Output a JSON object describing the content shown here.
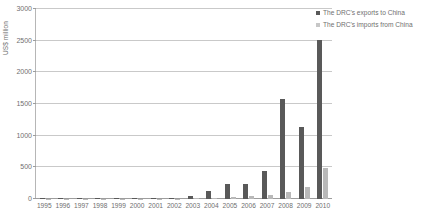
{
  "chart_data": {
    "type": "bar",
    "title": "",
    "xlabel": "",
    "ylabel": "US$ million",
    "ylim": [
      0,
      3000
    ],
    "yticks": [
      0,
      500,
      1000,
      1500,
      2000,
      2500,
      3000
    ],
    "ytick_labels": [
      "0",
      "500",
      "1000",
      "1500",
      "2000",
      "2500",
      "3000"
    ],
    "grid": true,
    "legend_position": "top-right",
    "categories": [
      "1995",
      "1996",
      "1997",
      "1998",
      "1999",
      "2000",
      "2001",
      "2002",
      "2003",
      "2004",
      "2005",
      "2006",
      "2007",
      "2008",
      "2009",
      "2010"
    ],
    "series": [
      {
        "name": "The DRC's exports to China",
        "color": "#595959",
        "values": [
          12,
          16,
          9,
          14,
          10,
          9,
          13,
          18,
          55,
          125,
          230,
          230,
          450,
          1580,
          1130,
          2510
        ]
      },
      {
        "name": "The DRC's imports from China",
        "color": "#b9b9b9",
        "values": [
          4,
          5,
          4,
          5,
          4,
          5,
          6,
          8,
          14,
          22,
          34,
          45,
          70,
          110,
          190,
          490
        ]
      }
    ]
  },
  "legend": {
    "items": [
      {
        "label": "The DRC's exports to China"
      },
      {
        "label": "The DRC's imports from China"
      }
    ]
  },
  "axes": {
    "y_title": "US$ million"
  }
}
